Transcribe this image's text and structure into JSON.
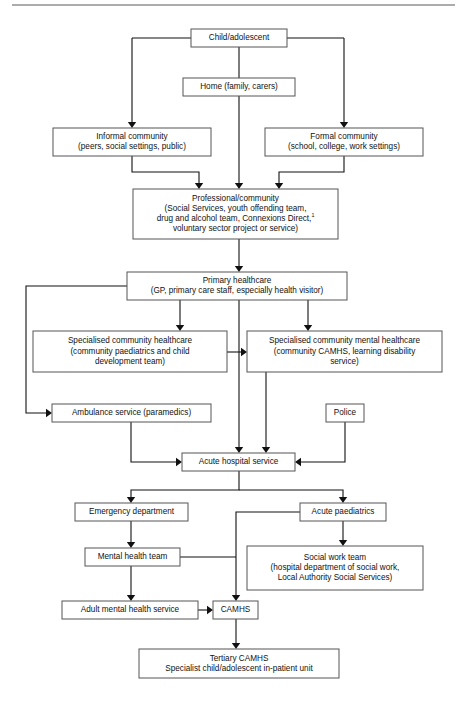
{
  "figure": {
    "type": "flowchart",
    "top_rule": true,
    "footnote_marker": "1"
  },
  "nodes": [
    {
      "id": "child",
      "name": "child-adolescent",
      "lines": [
        "Child/adolescent"
      ],
      "x": 191,
      "y": 29,
      "w": 96,
      "h": 18
    },
    {
      "id": "home",
      "name": "home-family-carers",
      "lines": [
        "Home (family, carers)"
      ],
      "x": 183,
      "y": 78,
      "w": 112,
      "h": 18
    },
    {
      "id": "informal",
      "name": "informal-community",
      "lines": [
        "Informal community",
        "(peers, social settings, public)"
      ],
      "x": 53,
      "y": 128,
      "w": 158,
      "h": 28
    },
    {
      "id": "formal",
      "name": "formal-community",
      "lines": [
        "Formal community",
        "(school, college, work settings)"
      ],
      "x": 265,
      "y": 128,
      "w": 158,
      "h": 28
    },
    {
      "id": "professional",
      "name": "professional-community",
      "lines": [
        "Professional/community",
        "(Social Services, youth offending team,",
        "drug and alcohol team, Connexions Direct,",
        "voluntary sector project or service)"
      ],
      "superscript_line": 2,
      "x": 133,
      "y": 189,
      "w": 205,
      "h": 50
    },
    {
      "id": "primary",
      "name": "primary-healthcare",
      "lines": [
        "Primary healthcare",
        "(GP, primary care staff, especially health visitor)"
      ],
      "x": 127,
      "y": 272,
      "w": 220,
      "h": 28
    },
    {
      "id": "spec_health",
      "name": "specialised-community-healthcare",
      "lines": [
        "Specialised community healthcare",
        "(community paediatrics and child",
        "development team)"
      ],
      "x": 33,
      "y": 331,
      "w": 194,
      "h": 41
    },
    {
      "id": "spec_mental",
      "name": "specialised-community-mental-healthcare",
      "lines": [
        "Specialised community mental healthcare",
        "(community CAMHS, learning disability",
        "service)"
      ],
      "x": 247,
      "y": 331,
      "w": 195,
      "h": 41
    },
    {
      "id": "ambulance",
      "name": "ambulance-service",
      "lines": [
        "Ambulance service (paramedics)"
      ],
      "x": 52,
      "y": 404,
      "w": 159,
      "h": 18
    },
    {
      "id": "police",
      "name": "police",
      "lines": [
        "Police"
      ],
      "x": 326,
      "y": 404,
      "w": 38,
      "h": 18
    },
    {
      "id": "acute_hospital",
      "name": "acute-hospital-service",
      "lines": [
        "Acute hospital service"
      ],
      "x": 182,
      "y": 453,
      "w": 113,
      "h": 18
    },
    {
      "id": "emergency",
      "name": "emergency-department",
      "lines": [
        "Emergency department"
      ],
      "x": 75,
      "y": 503,
      "w": 113,
      "h": 18
    },
    {
      "id": "acute_paed",
      "name": "acute-paediatrics",
      "lines": [
        "Acute paediatrics"
      ],
      "x": 300,
      "y": 503,
      "w": 86,
      "h": 18
    },
    {
      "id": "mental_team",
      "name": "mental-health-team",
      "lines": [
        "Mental health team"
      ],
      "x": 85,
      "y": 548,
      "w": 95,
      "h": 18
    },
    {
      "id": "social_work",
      "name": "social-work-team",
      "lines": [
        "Social work team",
        "(hospital department of social work,",
        "Local Authority Social Services)"
      ],
      "x": 247,
      "y": 546,
      "w": 176,
      "h": 44
    },
    {
      "id": "adult_mental",
      "name": "adult-mental-health-service",
      "lines": [
        "Adult mental health service"
      ],
      "x": 62,
      "y": 601,
      "w": 136,
      "h": 18
    },
    {
      "id": "camhs",
      "name": "camhs",
      "lines": [
        "CAMHS"
      ],
      "x": 213,
      "y": 601,
      "w": 45,
      "h": 18
    },
    {
      "id": "tertiary",
      "name": "tertiary-camhs",
      "lines": [
        "Tertiary CAMHS",
        "Specialist child/adolescent in-patient unit"
      ],
      "x": 139,
      "y": 649,
      "w": 200,
      "h": 29
    }
  ],
  "edges": [
    {
      "name": "edge-child-to-informal",
      "path": "M 239 47 L 239 38 M 132 38 L 132 124",
      "arrow": "down",
      "ax": 132,
      "ay": 128
    },
    {
      "name": "edge-child-to-formal",
      "path": "M 239 38 L 344 38 M 344 38 L 344 124",
      "arrow": "down",
      "ax": 344,
      "ay": 128
    },
    {
      "name": "edge-child-left-stub",
      "path": "M 132 38 L 239 38",
      "arrow": "none",
      "ax": 0,
      "ay": 0
    },
    {
      "name": "edge-child-to-home",
      "path": "M 239 47 L 239 78",
      "arrow": "none",
      "ax": 0,
      "ay": 0
    },
    {
      "name": "edge-home-to-professional",
      "path": "M 239 96 L 239 185",
      "arrow": "down",
      "ax": 239,
      "ay": 189
    },
    {
      "name": "edge-informal-to-professional",
      "path": "M 132 156 L 132 172 L 199 172 L 199 185",
      "arrow": "down",
      "ax": 199,
      "ay": 189
    },
    {
      "name": "edge-formal-to-professional",
      "path": "M 344 156 L 344 172 L 279 172 L 279 185",
      "arrow": "down",
      "ax": 279,
      "ay": 189
    },
    {
      "name": "edge-professional-to-primary",
      "path": "M 239 239 L 239 268",
      "arrow": "down",
      "ax": 239,
      "ay": 272
    },
    {
      "name": "edge-primary-to-spec-health",
      "path": "M 180 300 L 180 327",
      "arrow": "down",
      "ax": 180,
      "ay": 331
    },
    {
      "name": "edge-primary-to-spec-mental",
      "path": "M 308 300 L 308 327",
      "arrow": "down",
      "ax": 308,
      "ay": 331
    },
    {
      "name": "edge-primary-to-acute",
      "path": "M 239 300 L 239 449",
      "arrow": "down",
      "ax": 239,
      "ay": 453
    },
    {
      "name": "edge-primary-to-ambulance",
      "path": "M 127 286 L 26 286 L 26 413 L 48 413",
      "arrow": "right",
      "ax": 52,
      "ay": 413
    },
    {
      "name": "edge-spechealth-to-specmental",
      "path": "M 227 352 L 243 352",
      "arrow": "right",
      "ax": 247,
      "ay": 352
    },
    {
      "name": "edge-ambulance-to-acute",
      "path": "M 131 422 L 131 462 L 178 462",
      "arrow": "right",
      "ax": 182,
      "ay": 462
    },
    {
      "name": "edge-specmental-to-acute",
      "path": "M 266 372 L 266 449",
      "arrow": "down",
      "ax": 266,
      "ay": 453
    },
    {
      "name": "edge-police-to-acute",
      "path": "M 345 422 L 345 462 L 299 462",
      "arrow": "left",
      "ax": 295,
      "ay": 462
    },
    {
      "name": "edge-acute-to-emergency",
      "path": "M 239 471 L 239 490 L 131 490 L 131 499",
      "arrow": "down",
      "ax": 131,
      "ay": 503
    },
    {
      "name": "edge-acute-to-acutepaed",
      "path": "M 239 490 L 343 490 L 343 499",
      "arrow": "down",
      "ax": 343,
      "ay": 503
    },
    {
      "name": "edge-emergency-to-mental",
      "path": "M 131 521 L 131 544",
      "arrow": "down",
      "ax": 131,
      "ay": 548
    },
    {
      "name": "edge-acutepaed-to-socialwork",
      "path": "M 343 521 L 343 542",
      "arrow": "down",
      "ax": 343,
      "ay": 546
    },
    {
      "name": "edge-acutepaed-to-camhs",
      "path": "M 300 512 L 236 512 L 236 597",
      "arrow": "down",
      "ax": 236,
      "ay": 601
    },
    {
      "name": "edge-mental-to-camhs-link",
      "path": "M 180 557 L 236 557",
      "arrow": "none",
      "ax": 0,
      "ay": 0
    },
    {
      "name": "edge-mental-to-adult",
      "path": "M 131 566 L 131 597",
      "arrow": "down",
      "ax": 131,
      "ay": 601
    },
    {
      "name": "edge-adult-to-camhs",
      "path": "M 198 610 L 209 610",
      "arrow": "right",
      "ax": 213,
      "ay": 610
    },
    {
      "name": "edge-camhs-to-tertiary",
      "path": "M 236 619 L 236 645",
      "arrow": "down",
      "ax": 236,
      "ay": 649
    }
  ]
}
